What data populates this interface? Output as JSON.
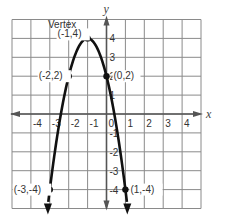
{
  "chart_data": {
    "type": "line",
    "title": "",
    "xlabel": "x",
    "ylabel": "y",
    "xlim": [
      -5,
      5
    ],
    "ylim": [
      -5,
      5
    ],
    "grid": true,
    "x_ticks": [
      "-4",
      "-3",
      "-2",
      "-1",
      "0",
      "1",
      "2",
      "3",
      "4"
    ],
    "y_ticks": [
      "4",
      "3",
      "2",
      "1",
      "-1",
      "-2",
      "-3",
      "-4"
    ],
    "equation": "y = -2(x + 1)^2 + 4",
    "series": [
      {
        "name": "parabola",
        "x": [
          -3,
          -2,
          -1,
          0,
          1
        ],
        "y": [
          -4,
          2,
          4,
          2,
          -4
        ],
        "arrows_at_ends": true
      }
    ],
    "points": [
      {
        "x": -1,
        "y": 4,
        "label": "(-1,4)"
      },
      {
        "x": -2,
        "y": 2,
        "label": "(-2,2)"
      },
      {
        "x": 0,
        "y": 2,
        "label": "(0,2)"
      },
      {
        "x": -3,
        "y": -4,
        "label": "(-3,-4)"
      },
      {
        "x": 1,
        "y": -4,
        "label": "(1,-4)"
      }
    ],
    "annotations": [
      {
        "text": "Vertex",
        "x": -1,
        "y": 4
      }
    ],
    "colors": {
      "grid": "#8a8a8a",
      "axis": "#555555",
      "curve": "#111111"
    }
  }
}
